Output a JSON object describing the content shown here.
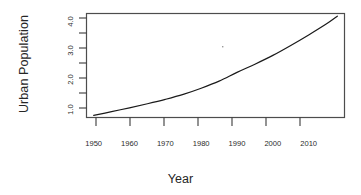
{
  "chart_data": {
    "type": "line",
    "title": "",
    "xlabel": "Year",
    "ylabel": "Urban Population",
    "xlim": [
      1948,
      2020
    ],
    "ylim": [
      0.75,
      4.3
    ],
    "grid": false,
    "legend": null,
    "x_ticks": [
      1950,
      1960,
      1970,
      1980,
      1990,
      2000,
      2010
    ],
    "x_tick_labels": [
      "1950",
      "1960",
      "1970",
      "1980",
      "1990",
      "2000",
      "2010"
    ],
    "y_ticks": [
      1.0,
      1.5,
      2.0,
      2.5,
      3.0,
      3.5,
      4.0
    ],
    "y_tick_labels": [
      "1.0",
      "",
      "2.0",
      "",
      "3.0",
      "",
      "4.0"
    ],
    "y_major_labels": [
      "1.0",
      "2.0",
      "3.0",
      "4.0"
    ],
    "series": [
      {
        "name": "Urban Population",
        "color": "#1a1a1a",
        "linewidth": 1.2,
        "x": [
          1950,
          1955,
          1960,
          1965,
          1970,
          1975,
          1980,
          1985,
          1990,
          1995,
          2000,
          2005,
          2010,
          2015,
          2018
        ],
        "y": [
          0.82,
          0.95,
          1.08,
          1.22,
          1.37,
          1.54,
          1.75,
          1.99,
          2.29,
          2.57,
          2.87,
          3.21,
          3.57,
          3.95,
          4.21
        ]
      }
    ]
  },
  "axis": {
    "y_title": "Urban Population",
    "x_title": "Year"
  }
}
